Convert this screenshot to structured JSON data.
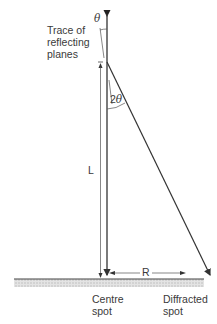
{
  "diagram": {
    "type": "electron diffraction geometry",
    "labels": {
      "theta": "θ",
      "trace_line1": "Trace of",
      "trace_line2": "reflecting",
      "trace_line3": "planes",
      "two_theta": "2θ",
      "L": "L",
      "R": "R",
      "centre_line1": "Centre",
      "centre_line2": "spot",
      "diffracted_line1": "Diffracted",
      "diffracted_line2": "spot"
    },
    "colors": {
      "line": "#333333",
      "ground_hatch": "#bdbdbd",
      "text": "#3a3a3a"
    }
  }
}
